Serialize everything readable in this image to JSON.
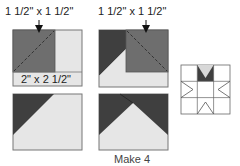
{
  "diagram": {
    "type": "quilt-block-construction",
    "colors": {
      "dark": "#3f3f3f",
      "medium": "#6e6e6e",
      "light": "#e6e6e6",
      "outline": "#777777"
    },
    "steps": [
      {
        "id": "step1",
        "top_label": "1 1/2\" x 1 1/2\"",
        "bottom_label": "2\" x 2 1/2\""
      },
      {
        "id": "step2",
        "top_label": "1 1/2\" x 1 1/2\""
      },
      {
        "id": "step3"
      },
      {
        "id": "step4"
      }
    ],
    "caption": "Make 4",
    "star_block": {
      "grid": "3x3",
      "highlight_cell": "top-middle"
    }
  }
}
